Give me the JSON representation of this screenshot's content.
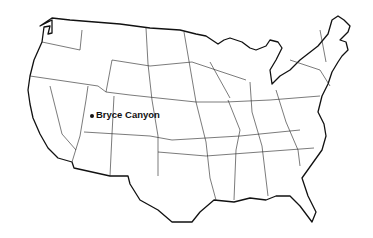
{
  "map": {
    "region": "Contiguous United States",
    "style": "black outline, state borders",
    "marker_color": "#111111",
    "markers": [
      {
        "label": "Bryce Canyon",
        "x": 92,
        "y": 116
      }
    ]
  }
}
